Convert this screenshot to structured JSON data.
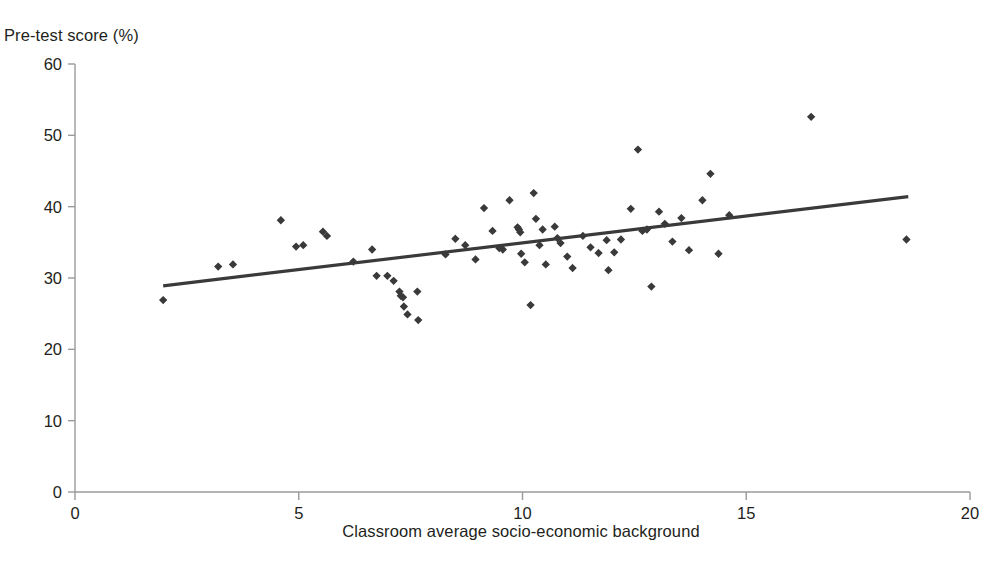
{
  "chart_data": {
    "type": "scatter",
    "title": "",
    "xlabel": "Classroom average socio-economic background",
    "ylabel": "Pre-test score (%)",
    "xlim": [
      0,
      20
    ],
    "ylim": [
      0,
      60
    ],
    "xticks": [
      0,
      5,
      10,
      15,
      20
    ],
    "yticks": [
      0,
      10,
      20,
      30,
      40,
      50,
      60
    ],
    "xtick_labels": [
      "0",
      "5",
      "10",
      "15",
      "20"
    ],
    "ytick_labels": [
      "0",
      "10",
      "20",
      "30",
      "40",
      "50",
      "60"
    ],
    "grid": false,
    "legend": null,
    "marker_color": "#3a3a3a",
    "line_color": "#3a3a3a",
    "axis_color": "#9a9a9a",
    "points": [
      [
        1.97,
        26.9
      ],
      [
        3.2,
        31.6
      ],
      [
        3.53,
        31.9
      ],
      [
        4.6,
        38.1
      ],
      [
        4.94,
        34.4
      ],
      [
        5.1,
        34.6
      ],
      [
        5.54,
        36.5
      ],
      [
        5.63,
        35.9
      ],
      [
        6.22,
        32.3
      ],
      [
        6.64,
        34.0
      ],
      [
        6.74,
        30.3
      ],
      [
        6.98,
        30.3
      ],
      [
        7.12,
        29.6
      ],
      [
        7.25,
        28.1
      ],
      [
        7.28,
        27.5
      ],
      [
        7.33,
        27.3
      ],
      [
        7.35,
        26.0
      ],
      [
        7.43,
        24.9
      ],
      [
        7.65,
        28.1
      ],
      [
        7.67,
        24.1
      ],
      [
        8.28,
        33.3
      ],
      [
        8.5,
        35.5
      ],
      [
        8.72,
        34.6
      ],
      [
        8.95,
        32.6
      ],
      [
        9.14,
        39.8
      ],
      [
        9.33,
        36.6
      ],
      [
        9.48,
        34.2
      ],
      [
        9.56,
        34.0
      ],
      [
        9.71,
        40.9
      ],
      [
        9.89,
        37.1
      ],
      [
        9.92,
        36.8
      ],
      [
        9.95,
        36.4
      ],
      [
        9.97,
        33.4
      ],
      [
        10.05,
        32.2
      ],
      [
        10.18,
        26.2
      ],
      [
        10.25,
        41.9
      ],
      [
        10.3,
        38.3
      ],
      [
        10.38,
        34.6
      ],
      [
        10.45,
        36.8
      ],
      [
        10.52,
        31.9
      ],
      [
        10.72,
        37.2
      ],
      [
        10.78,
        35.6
      ],
      [
        10.85,
        34.9
      ],
      [
        11.0,
        33.0
      ],
      [
        11.12,
        31.4
      ],
      [
        11.35,
        35.9
      ],
      [
        11.52,
        34.3
      ],
      [
        11.7,
        33.5
      ],
      [
        11.88,
        35.3
      ],
      [
        11.92,
        31.1
      ],
      [
        12.05,
        33.6
      ],
      [
        12.2,
        35.4
      ],
      [
        12.42,
        39.7
      ],
      [
        12.58,
        48.0
      ],
      [
        12.68,
        36.6
      ],
      [
        12.78,
        36.8
      ],
      [
        12.88,
        28.8
      ],
      [
        13.05,
        39.3
      ],
      [
        13.18,
        37.6
      ],
      [
        13.35,
        35.1
      ],
      [
        13.55,
        38.4
      ],
      [
        13.72,
        33.9
      ],
      [
        14.02,
        40.9
      ],
      [
        14.2,
        44.6
      ],
      [
        14.38,
        33.4
      ],
      [
        14.62,
        38.8
      ],
      [
        16.45,
        52.6
      ],
      [
        18.58,
        35.4
      ]
    ],
    "trendline": {
      "x": [
        1.97,
        18.62
      ],
      "y": [
        28.9,
        41.4
      ],
      "description": "positive linear fit line"
    }
  },
  "geometry": {
    "plot_left_px": 75,
    "plot_right_px": 970,
    "plot_top_px": 64,
    "plot_bottom_px": 492
  }
}
